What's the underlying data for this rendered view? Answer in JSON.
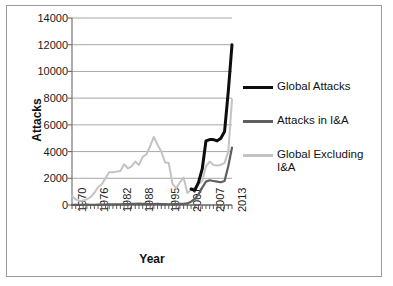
{
  "chart_data": {
    "type": "line",
    "title": "",
    "xlabel": "Year",
    "ylabel": "Attacks",
    "xlim": [
      1970,
      2013
    ],
    "ylim": [
      0,
      14000
    ],
    "grid": true,
    "legend_position": "right",
    "ytick_labels": [
      "14000",
      "12000",
      "10000",
      "8000",
      "6000",
      "4000",
      "2000",
      "0"
    ],
    "ytick_values": [
      14000,
      12000,
      10000,
      8000,
      6000,
      4000,
      2000,
      0
    ],
    "xtick_labels": [
      "1970",
      "1976",
      "1982",
      "1988",
      "1995",
      "2001",
      "2007",
      "2013"
    ],
    "xtick_values": [
      1970,
      1976,
      1982,
      1988,
      1995,
      2001,
      2007,
      2013
    ],
    "x": [
      1970,
      1971,
      1972,
      1973,
      1974,
      1975,
      1976,
      1977,
      1978,
      1979,
      1980,
      1981,
      1982,
      1983,
      1984,
      1985,
      1986,
      1987,
      1988,
      1989,
      1990,
      1991,
      1992,
      1993,
      1994,
      1995,
      1996,
      1997,
      1998,
      1999,
      2000,
      2001,
      2002,
      2003,
      2004,
      2005,
      2006,
      2007,
      2008,
      2009,
      2010,
      2011,
      2012,
      2013
    ],
    "series": [
      {
        "name": "Global Attacks",
        "color": "#0d0d0d",
        "x": [
          2002,
          2003,
          2004,
          2005,
          2006,
          2007,
          2008,
          2009,
          2010,
          2011,
          2012,
          2013
        ],
        "values": [
          1200,
          1100,
          1700,
          2700,
          4800,
          4900,
          4900,
          4800,
          5000,
          5500,
          8500,
          12000
        ]
      },
      {
        "name": "Attacks in I&A",
        "color": "#5f5f5f",
        "x": [
          1970,
          1971,
          1972,
          1973,
          1974,
          1975,
          1976,
          1977,
          1978,
          1979,
          1980,
          1981,
          1982,
          1983,
          1984,
          1985,
          1986,
          1987,
          1988,
          1989,
          1990,
          1991,
          1992,
          1993,
          1994,
          1995,
          1996,
          1997,
          1998,
          1999,
          2000,
          2001,
          2002,
          2003,
          2004,
          2005,
          2006,
          2007,
          2008,
          2009,
          2010,
          2011,
          2012,
          2013
        ],
        "values": [
          20,
          15,
          15,
          20,
          25,
          20,
          20,
          25,
          30,
          35,
          40,
          45,
          50,
          55,
          60,
          70,
          80,
          90,
          100,
          90,
          80,
          70,
          75,
          80,
          70,
          60,
          55,
          60,
          70,
          80,
          90,
          120,
          250,
          450,
          800,
          1300,
          1750,
          1850,
          1800,
          1750,
          1700,
          1800,
          2900,
          4300
        ]
      },
      {
        "name": "Global Excluding I&A",
        "color": "#c3c3c3",
        "x": [
          1970,
          1971,
          1972,
          1973,
          1974,
          1975,
          1976,
          1977,
          1978,
          1979,
          1980,
          1981,
          1982,
          1983,
          1984,
          1985,
          1986,
          1987,
          1988,
          1989,
          1990,
          1991,
          1992,
          1993,
          1994,
          1995,
          1996,
          1997,
          1998,
          1999,
          2000,
          2001,
          2002,
          2003,
          2004,
          2005,
          2006,
          2007,
          2008,
          2009,
          2010,
          2011,
          2012,
          2013
        ],
        "values": [
          650,
          420,
          300,
          330,
          430,
          600,
          900,
          1350,
          1550,
          2000,
          2450,
          2450,
          2500,
          2550,
          3050,
          2750,
          2900,
          3250,
          3000,
          3600,
          3800,
          4400,
          5100,
          4500,
          4000,
          3200,
          3150,
          1600,
          1250,
          1700,
          2050,
          900,
          1150,
          1300,
          1550,
          1800,
          2900,
          3250,
          3000,
          2950,
          3000,
          3150,
          4000,
          7900
        ]
      }
    ]
  },
  "axes": {
    "y_title": "Attacks",
    "x_title": "Year"
  },
  "legend": {
    "items": [
      {
        "label": "Global Attacks",
        "swatch": "black-line-swatch"
      },
      {
        "label": "Attacks in I&A",
        "swatch": "dark-gray-line-swatch"
      },
      {
        "label": "Global Excluding I&A",
        "swatch": "light-gray-line-swatch"
      }
    ]
  }
}
